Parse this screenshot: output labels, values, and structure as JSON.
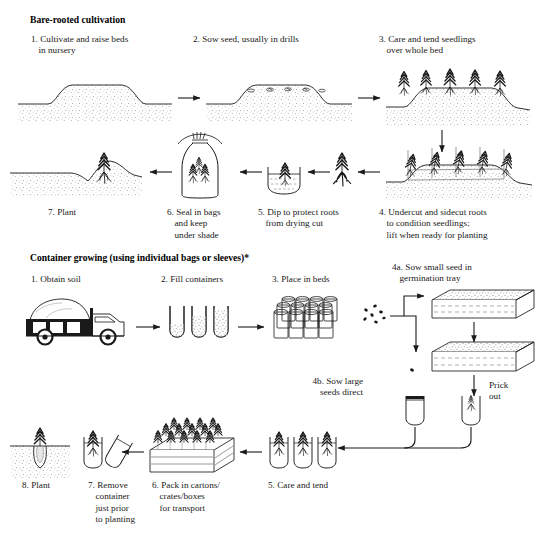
{
  "diagram": {
    "title_implicit": "Nursery production of seedlings",
    "sections": [
      {
        "id": "bare-rooted",
        "heading": "Bare-rooted cultivation",
        "steps": [
          {
            "num": "1.",
            "text": "Cultivate and raise beds\nin nursery",
            "icon": "raised-bed-icon"
          },
          {
            "num": "2.",
            "text": "Sow seed, usually in drills",
            "icon": "sown-bed-icon"
          },
          {
            "num": "3.",
            "text": "Care and tend seedlings\nover whole bed",
            "icon": "seedling-bed-icon"
          },
          {
            "num": "4.",
            "text": "Undercut and sidecut roots\nto condition seedlings;\nlift when ready for planting",
            "icon": "undercut-bed-icon"
          },
          {
            "num": "5.",
            "text": "Dip to protect roots\nfrom drying cut",
            "icon": "dipping-basin-icon"
          },
          {
            "num": "6.",
            "text": "Seal in bags\nand keep\nunder shade",
            "icon": "sealed-bag-icon"
          },
          {
            "num": "7.",
            "text": "Plant",
            "icon": "planted-seedling-icon"
          }
        ]
      },
      {
        "id": "container-growing",
        "heading": "Container growing (using individual bags or sleeves)*",
        "steps": [
          {
            "num": "1.",
            "text": "Obtain soil",
            "icon": "soil-truck-icon"
          },
          {
            "num": "2.",
            "text": "Fill containers",
            "icon": "filled-tubes-icon"
          },
          {
            "num": "3.",
            "text": "Place in beds",
            "icon": "container-cluster-icon"
          },
          {
            "num": "4a.",
            "text": "Sow small seed in\ngermination tray",
            "icon": "germination-tray-icon"
          },
          {
            "num": "4b.",
            "text": "Sow large\nseeds direct",
            "icon": "seed-direct-icon"
          },
          {
            "num": "5.",
            "text": "Care and tend",
            "icon": "potted-seedlings-icon"
          },
          {
            "num": "6.",
            "text": "Pack in cartons/\ncrates/boxes\nfor transport",
            "icon": "packed-crate-icon"
          },
          {
            "num": "7.",
            "text": "Remove\ncontainer\njust prior\nto planting",
            "icon": "remove-sleeve-icon"
          },
          {
            "num": "8.",
            "text": "Plant",
            "icon": "planting-hole-icon"
          }
        ],
        "annotations": [
          {
            "id": "prick-out",
            "text": "Prick\nout"
          }
        ]
      }
    ],
    "colors": {
      "ink": "#1a1a1a",
      "soil_stipple": "#8a8a8a",
      "paper": "#ffffff"
    }
  }
}
